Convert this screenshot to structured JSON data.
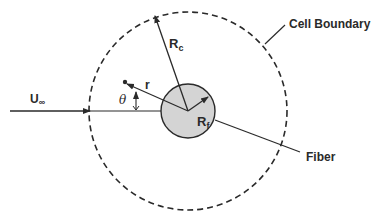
{
  "diagram": {
    "type": "cell-model-schematic",
    "labels": {
      "top_cutoff": "...",
      "cell_boundary": "Cell Boundary",
      "fiber": "Fiber",
      "free_stream_velocity": "U",
      "free_stream_sub": "∞",
      "cell_radius": "R",
      "cell_radius_sub": "c",
      "fiber_radius": "R",
      "fiber_radius_sub": "f",
      "radial_coordinate": "r",
      "angle": "θ"
    },
    "colors": {
      "stroke": "#2a2a2a",
      "fiber_fill": "#d4d4d4",
      "background": "#ffffff"
    },
    "geometry": {
      "center": [
        188,
        111
      ],
      "cell_radius_px": 99,
      "fiber_radius_px": 27
    }
  }
}
